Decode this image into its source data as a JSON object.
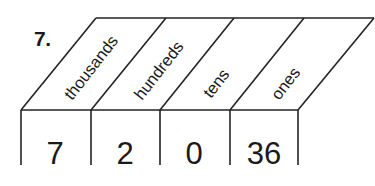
{
  "problem": {
    "number": "7."
  },
  "place_value_chart": {
    "headers": [
      "thousands",
      "hundreds",
      "tens",
      "ones"
    ],
    "values": [
      "7",
      "2",
      "0",
      "36"
    ]
  }
}
